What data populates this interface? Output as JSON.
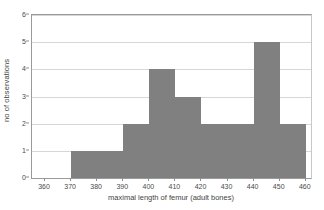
{
  "chart_data": {
    "type": "bar",
    "title": "",
    "subtitle": "",
    "xlabel": "maximal length of femur (adult bones)",
    "ylabel": "no of observations",
    "xlim": [
      355,
      462
    ],
    "ylim": [
      0,
      6
    ],
    "xticks": [
      360,
      370,
      380,
      390,
      400,
      410,
      420,
      430,
      440,
      450,
      460
    ],
    "yticks": [
      0,
      1,
      2,
      3,
      4,
      5,
      6
    ],
    "xtick_labels": [
      "360",
      "370",
      "380",
      "390",
      "400",
      "410",
      "420",
      "430",
      "440",
      "450",
      "460"
    ],
    "ytick_labels": [
      "0",
      "1",
      "2",
      "3",
      "4",
      "5",
      "6"
    ],
    "grid": "horizontal",
    "legend": "none",
    "bin_width": 10,
    "bin_edges": [
      360,
      370,
      380,
      390,
      400,
      410,
      420,
      430,
      440,
      450,
      460
    ],
    "categories": [
      "360-370",
      "370-380",
      "380-390",
      "390-400",
      "400-410",
      "410-420",
      "420-430",
      "430-440",
      "440-450",
      "450-460"
    ],
    "values": [
      0,
      1,
      1,
      2,
      4,
      3,
      2,
      2,
      5,
      2
    ],
    "bar_color": "#808080",
    "grid_color": "#d7d7d7",
    "axis_color": "#9a9a9a",
    "background_color": "#ffffff",
    "total_observations": 22
  }
}
